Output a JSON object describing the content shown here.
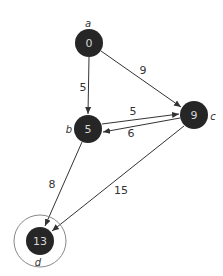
{
  "graph": {
    "nodes": [
      {
        "id": "a",
        "name": "a",
        "value": "0",
        "x": 89,
        "y": 43,
        "name_x": 88,
        "name_y": 23
      },
      {
        "id": "b",
        "name": "b",
        "value": "5",
        "x": 88,
        "y": 129,
        "name_x": 69,
        "name_y": 129
      },
      {
        "id": "c",
        "name": "c",
        "value": "9",
        "x": 194,
        "y": 115,
        "name_x": 213,
        "name_y": 116
      },
      {
        "id": "d",
        "name": "d",
        "value": "13",
        "x": 40,
        "y": 241,
        "name_x": 38,
        "name_y": 262,
        "target": true
      }
    ],
    "edges": [
      {
        "from": "a",
        "to": "b",
        "weight": "5",
        "label_x": 83,
        "label_y": 87
      },
      {
        "from": "a",
        "to": "c",
        "weight": "9",
        "label_x": 143,
        "label_y": 70
      },
      {
        "from": "b",
        "to": "c",
        "weight": "5",
        "label_x": 133,
        "label_y": 111
      },
      {
        "from": "c",
        "to": "b",
        "weight": "6",
        "label_x": 131,
        "label_y": 133
      },
      {
        "from": "b",
        "to": "d",
        "weight": "8",
        "label_x": 52,
        "label_y": 184
      },
      {
        "from": "c",
        "to": "d",
        "weight": "15",
        "label_x": 121,
        "label_y": 190
      }
    ]
  },
  "colors": {
    "node_fill": "#262626",
    "node_text": "#d8d8d8",
    "edge": "#333333",
    "ring": "#888888"
  }
}
